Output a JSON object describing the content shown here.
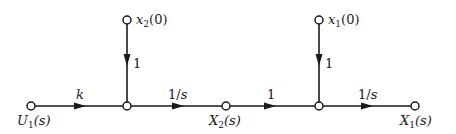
{
  "diagram": {
    "type": "signal-flow-graph",
    "nodes": [
      {
        "id": "U1",
        "label_main": "U",
        "label_sub": "1",
        "label_tail": "(s)",
        "x": 31,
        "y": 106
      },
      {
        "id": "A",
        "label_main": "",
        "x": 127,
        "y": 106
      },
      {
        "id": "x2_0",
        "label_main": "x",
        "label_sub": "2",
        "label_tail": "(0)",
        "x": 127,
        "y": 20
      },
      {
        "id": "X2",
        "label_main": "X",
        "label_sub": "2",
        "label_tail": "(s)",
        "x": 226,
        "y": 106
      },
      {
        "id": "B",
        "label_main": "",
        "x": 319,
        "y": 106
      },
      {
        "id": "x1_0",
        "label_main": "x",
        "label_sub": "1",
        "label_tail": "(0)",
        "x": 319,
        "y": 20
      },
      {
        "id": "X1",
        "label_main": "X",
        "label_sub": "1",
        "label_tail": "(s)",
        "x": 415,
        "y": 106
      }
    ],
    "edges": [
      {
        "from": "U1",
        "to": "A",
        "gain": "k"
      },
      {
        "from": "x2_0",
        "to": "A",
        "gain": "1"
      },
      {
        "from": "A",
        "to": "X2",
        "gain": "1/s"
      },
      {
        "from": "X2",
        "to": "B",
        "gain": "1"
      },
      {
        "from": "x1_0",
        "to": "B",
        "gain": "1"
      },
      {
        "from": "B",
        "to": "X1",
        "gain": "1/s"
      }
    ]
  }
}
